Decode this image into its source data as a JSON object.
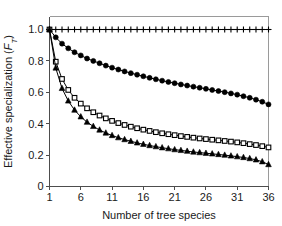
{
  "chart_data": {
    "type": "line",
    "title": "",
    "xlabel": "Number of tree species",
    "ylabel": "Effective specialization (F_T)",
    "ylabel_parts": {
      "main": "Effective specialization (",
      "italic": "F",
      "sub": "T",
      "close": ")"
    },
    "xlim": [
      1,
      36
    ],
    "ylim": [
      0,
      1.05
    ],
    "xticks": [
      1,
      6,
      11,
      16,
      21,
      26,
      31,
      36
    ],
    "xtick_labels": [
      "1",
      "6",
      "11",
      "16",
      "21",
      "26",
      "31",
      "36"
    ],
    "yticks": [
      0,
      0.2,
      0.4,
      0.6,
      0.8,
      1.0
    ],
    "ytick_labels": [
      "0",
      "0.2",
      "0.4",
      "0.6",
      "0.8",
      "1.0"
    ],
    "grid": false,
    "legend": "none",
    "x": [
      1,
      2,
      3,
      4,
      5,
      6,
      7,
      8,
      9,
      10,
      11,
      12,
      13,
      14,
      15,
      16,
      17,
      18,
      19,
      20,
      21,
      22,
      23,
      24,
      25,
      26,
      27,
      28,
      29,
      30,
      31,
      32,
      33,
      34,
      35,
      36
    ],
    "series": [
      {
        "name": "plus-series",
        "marker": "plus",
        "fill": "none",
        "color": "#000000",
        "values": [
          1.0,
          1.0,
          1.0,
          1.0,
          1.0,
          1.0,
          1.0,
          1.0,
          1.0,
          1.0,
          1.0,
          1.0,
          1.0,
          1.0,
          1.0,
          1.0,
          1.0,
          1.0,
          1.0,
          1.0,
          1.0,
          1.0,
          1.0,
          1.0,
          1.0,
          1.0,
          1.0,
          1.0,
          1.0,
          1.0,
          1.0,
          1.0,
          1.0,
          1.0,
          1.0,
          1.0
        ]
      },
      {
        "name": "filled-circle-series",
        "marker": "circle",
        "fill": "solid",
        "color": "#000000",
        "values": [
          1.0,
          0.95,
          0.91,
          0.88,
          0.855,
          0.835,
          0.815,
          0.8,
          0.785,
          0.77,
          0.757,
          0.745,
          0.733,
          0.722,
          0.712,
          0.702,
          0.692,
          0.683,
          0.674,
          0.666,
          0.658,
          0.65,
          0.643,
          0.636,
          0.629,
          0.622,
          0.615,
          0.608,
          0.601,
          0.593,
          0.585,
          0.575,
          0.565,
          0.553,
          0.54,
          0.523
        ]
      },
      {
        "name": "open-square-series",
        "marker": "square",
        "fill": "open",
        "color": "#000000",
        "values": [
          1.0,
          0.795,
          0.685,
          0.615,
          0.565,
          0.528,
          0.498,
          0.473,
          0.452,
          0.434,
          0.418,
          0.404,
          0.392,
          0.381,
          0.371,
          0.362,
          0.354,
          0.346,
          0.339,
          0.333,
          0.327,
          0.321,
          0.316,
          0.311,
          0.306,
          0.302,
          0.298,
          0.294,
          0.29,
          0.286,
          0.281,
          0.276,
          0.27,
          0.264,
          0.257,
          0.249
        ]
      },
      {
        "name": "filled-triangle-series",
        "marker": "triangle",
        "fill": "solid",
        "color": "#000000",
        "values": [
          1.0,
          0.755,
          0.625,
          0.545,
          0.487,
          0.444,
          0.41,
          0.383,
          0.36,
          0.341,
          0.325,
          0.311,
          0.299,
          0.288,
          0.278,
          0.269,
          0.261,
          0.254,
          0.247,
          0.241,
          0.235,
          0.23,
          0.225,
          0.22,
          0.216,
          0.212,
          0.208,
          0.204,
          0.2,
          0.195,
          0.19,
          0.185,
          0.178,
          0.17,
          0.158,
          0.14
        ]
      }
    ]
  }
}
